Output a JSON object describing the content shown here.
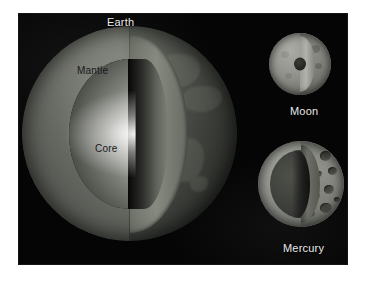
{
  "figure": {
    "kind": "planetary-interior-cutaway-illustration",
    "background_color": "#ffffff",
    "panel_color": "#050505"
  },
  "bodies": [
    {
      "id": "earth",
      "label": "Earth",
      "layers": [
        {
          "name": "Mantle",
          "label": "Mantle",
          "color": "#7c7f77"
        },
        {
          "name": "Core",
          "label": "Core",
          "color": "#cfd0cb"
        }
      ]
    },
    {
      "id": "moon",
      "label": "Moon",
      "layers": [
        {
          "name": "Mantle",
          "label": "",
          "color": "#8e9089"
        },
        {
          "name": "Core",
          "label": "",
          "color": "#262824"
        }
      ]
    },
    {
      "id": "mercury",
      "label": "Mercury",
      "layers": [
        {
          "name": "Mantle",
          "label": "",
          "color": "#8e908a"
        },
        {
          "name": "Core",
          "label": "",
          "color": "#3d3f3a"
        }
      ]
    }
  ],
  "labels": {
    "earth": "Earth",
    "mantle": "Mantle",
    "core": "Core",
    "moon": "Moon",
    "mercury": "Mercury"
  }
}
